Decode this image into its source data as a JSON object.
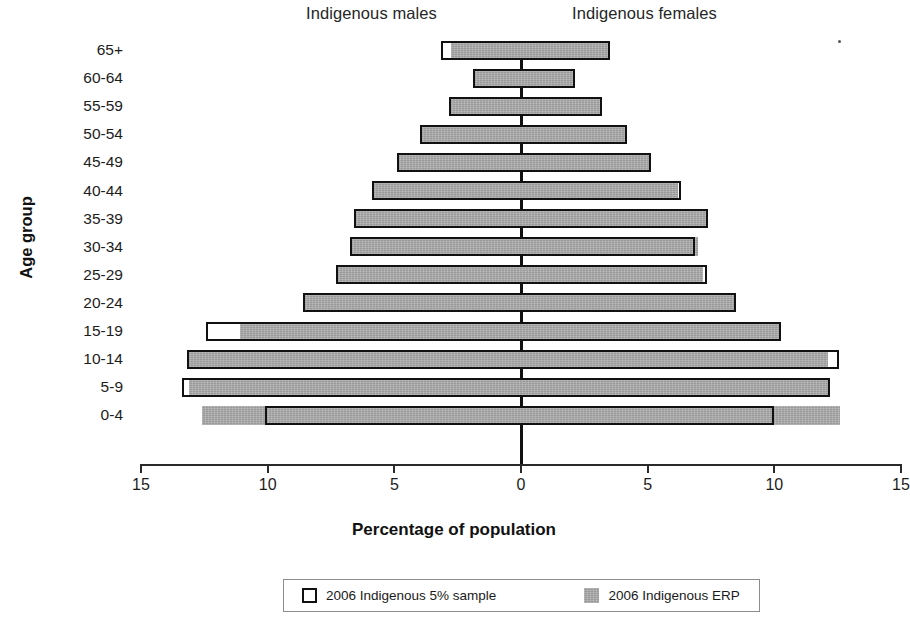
{
  "titles": {
    "males": "Indigenous males",
    "females": "Indigenous females",
    "y_axis": "Age group",
    "x_axis": "Percentage of population"
  },
  "legend": {
    "sample_label": "2006 Indigenous 5% sample",
    "erp_label": "2006 Indigenous ERP",
    "sample_color": "#ffffff",
    "sample_border_color": "#111111",
    "erp_color": "#a9a9a9"
  },
  "axis": {
    "tick_labels": [
      "15",
      "10",
      "5",
      "0",
      "5",
      "10",
      "15"
    ],
    "tick_values": [
      -15,
      -10,
      -5,
      0,
      5,
      10,
      15
    ]
  },
  "chart_data": {
    "type": "bar",
    "subtype": "population-pyramid",
    "title": "",
    "xlabel": "Percentage of population",
    "ylabel": "Age group",
    "xlim": [
      -15,
      15
    ],
    "grid": false,
    "legend_position": "bottom",
    "categories": [
      "0-4",
      "5-9",
      "10-14",
      "15-19",
      "20-24",
      "25-29",
      "30-34",
      "35-39",
      "40-44",
      "45-49",
      "50-54",
      "55-59",
      "60-64",
      "65+"
    ],
    "series": [
      {
        "name": "2006 Indigenous 5% sample",
        "side": "male",
        "values": [
          10.1,
          13.4,
          13.2,
          12.45,
          8.6,
          7.3,
          6.75,
          6.6,
          5.9,
          4.9,
          4.0,
          2.85,
          1.9,
          3.15
        ]
      },
      {
        "name": "2006 Indigenous ERP",
        "side": "male",
        "values": [
          12.6,
          13.1,
          13.2,
          11.1,
          8.6,
          7.3,
          6.75,
          6.6,
          5.9,
          4.9,
          4.0,
          2.85,
          1.9,
          2.75
        ]
      },
      {
        "name": "2006 Indigenous 5% sample",
        "side": "female",
        "values": [
          10.0,
          12.2,
          12.55,
          10.25,
          8.5,
          7.35,
          6.85,
          7.4,
          6.3,
          5.15,
          4.2,
          3.2,
          2.15,
          3.5
        ]
      },
      {
        "name": "2006 Indigenous ERP",
        "side": "female",
        "values": [
          12.6,
          12.2,
          12.1,
          10.25,
          8.5,
          7.2,
          7.0,
          7.3,
          6.2,
          5.1,
          4.15,
          3.1,
          2.1,
          3.45
        ]
      }
    ]
  }
}
